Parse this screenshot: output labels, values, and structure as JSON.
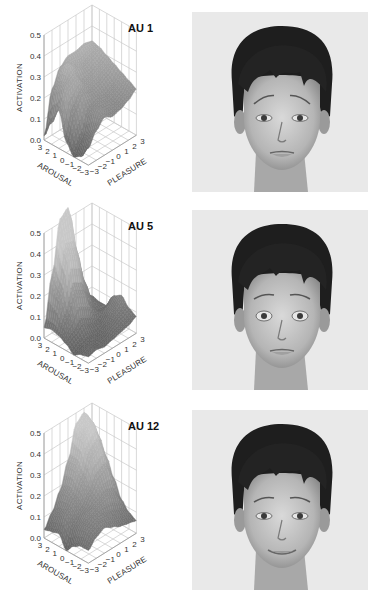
{
  "figure": {
    "rows": [
      {
        "title": "AU 1",
        "face_label": "face-brows-raised",
        "expression": "inner brows raised, sad/concerned",
        "mouth": "neutral",
        "eyes": "normal",
        "brow_tilt": 1
      },
      {
        "title": "AU 5",
        "face_label": "face-eyes-widened",
        "expression": "upper lid raised, wide eyes",
        "mouth": "neutral",
        "eyes": "wide",
        "brow_tilt": 0
      },
      {
        "title": "AU 12",
        "face_label": "face-smiling",
        "expression": "lip corner puller, smile",
        "mouth": "smile",
        "eyes": "normal",
        "brow_tilt": 0
      }
    ],
    "axes": {
      "zlabel": "ACTIVATION",
      "xlabel": "AROUSAL",
      "ylabel": "PLEASURE",
      "zticks": [
        "0.0",
        "0.1",
        "0.2",
        "0.3",
        "0.4",
        "0.5"
      ],
      "arousal_ticks": [
        "3",
        "2",
        "1",
        "0",
        "−1",
        "−2",
        "−3"
      ],
      "pleasure_ticks": [
        "−3",
        "−2",
        "−1",
        "0",
        "1",
        "2",
        "3"
      ]
    }
  },
  "chart_data": [
    {
      "type": "surface3d",
      "title": "AU 1",
      "xlabel": "AROUSAL",
      "ylabel": "PLEASURE",
      "zlabel": "ACTIVATION",
      "x_range": [
        -3,
        3
      ],
      "y_range": [
        -3,
        3
      ],
      "zlim": [
        0,
        0.5
      ],
      "grid": true,
      "x": [
        3,
        2,
        1,
        0,
        -1,
        -2,
        -3
      ],
      "y": [
        -3,
        -2,
        -1,
        0,
        1,
        2,
        3
      ],
      "z_rows_by_arousal": [
        [
          0.02,
          0.22,
          0.3,
          0.33,
          0.33,
          0.34,
          0.33
        ],
        [
          0.1,
          0.26,
          0.34,
          0.3,
          0.28,
          0.3,
          0.32
        ],
        [
          0.18,
          0.28,
          0.3,
          0.25,
          0.26,
          0.28,
          0.3
        ],
        [
          0.05,
          0.18,
          0.24,
          0.22,
          0.23,
          0.25,
          0.28
        ],
        [
          0.0,
          0.06,
          0.18,
          0.2,
          0.2,
          0.22,
          0.26
        ],
        [
          0.02,
          0.1,
          0.2,
          0.18,
          0.18,
          0.2,
          0.24
        ],
        [
          0.08,
          0.14,
          0.18,
          0.16,
          0.17,
          0.19,
          0.22
        ]
      ]
    },
    {
      "type": "surface3d",
      "title": "AU 5",
      "xlabel": "AROUSAL",
      "ylabel": "PLEASURE",
      "zlabel": "ACTIVATION",
      "x_range": [
        -3,
        3
      ],
      "y_range": [
        -3,
        3
      ],
      "zlim": [
        0,
        0.5
      ],
      "grid": true,
      "x": [
        3,
        2,
        1,
        0,
        -1,
        -2,
        -3
      ],
      "y": [
        -3,
        -2,
        -1,
        0,
        1,
        2,
        3
      ],
      "z_rows_by_arousal": [
        [
          0.05,
          0.28,
          0.52,
          0.55,
          0.3,
          0.1,
          0.06
        ],
        [
          0.06,
          0.22,
          0.4,
          0.38,
          0.2,
          0.08,
          0.05
        ],
        [
          0.05,
          0.12,
          0.22,
          0.2,
          0.1,
          0.05,
          0.05
        ],
        [
          0.03,
          0.05,
          0.08,
          0.06,
          0.04,
          0.08,
          0.12
        ],
        [
          0.0,
          0.02,
          0.03,
          0.02,
          0.05,
          0.1,
          0.14
        ],
        [
          0.02,
          0.03,
          0.02,
          0.03,
          0.06,
          0.08,
          0.1
        ],
        [
          0.03,
          0.04,
          0.03,
          0.04,
          0.05,
          0.06,
          0.08
        ]
      ]
    },
    {
      "type": "surface3d",
      "title": "AU 12",
      "xlabel": "AROUSAL",
      "ylabel": "PLEASURE",
      "zlabel": "ACTIVATION",
      "x_range": [
        -3,
        3
      ],
      "y_range": [
        -3,
        3
      ],
      "zlim": [
        0,
        0.5
      ],
      "grid": true,
      "x": [
        3,
        2,
        1,
        0,
        -1,
        -2,
        -3
      ],
      "y": [
        -3,
        -2,
        -1,
        0,
        1,
        2,
        3
      ],
      "z_rows_by_arousal": [
        [
          0.04,
          0.1,
          0.18,
          0.3,
          0.45,
          0.48,
          0.4
        ],
        [
          0.05,
          0.12,
          0.2,
          0.3,
          0.42,
          0.46,
          0.36
        ],
        [
          0.06,
          0.14,
          0.18,
          0.25,
          0.35,
          0.38,
          0.28
        ],
        [
          0.0,
          0.1,
          0.15,
          0.2,
          0.26,
          0.28,
          0.2
        ],
        [
          0.04,
          0.12,
          0.16,
          0.18,
          0.2,
          0.18,
          0.12
        ],
        [
          0.06,
          0.12,
          0.14,
          0.14,
          0.12,
          0.1,
          0.08
        ],
        [
          0.06,
          0.1,
          0.12,
          0.1,
          0.08,
          0.07,
          0.06
        ]
      ]
    }
  ]
}
